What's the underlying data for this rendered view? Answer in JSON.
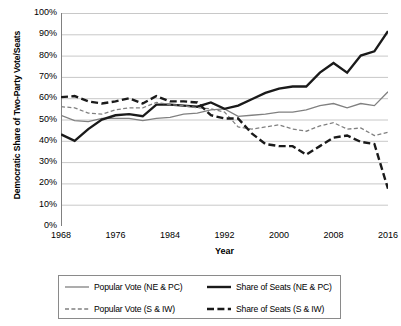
{
  "chart_data": {
    "type": "line",
    "title": "",
    "xlabel": "Year",
    "ylabel": "Democratic Share of Two-Party Vote/Seats",
    "xlim": [
      1968,
      2016
    ],
    "ylim": [
      0,
      1
    ],
    "grid": true,
    "legend_position": "bottom",
    "x_tick_labels": [
      "1968",
      "1976",
      "1984",
      "1992",
      "2000",
      "2008",
      "2016"
    ],
    "x_ticks": [
      1968,
      1976,
      1984,
      1992,
      2000,
      2008,
      2016
    ],
    "y_tick_labels": [
      "0%",
      "10%",
      "20%",
      "30%",
      "40%",
      "50%",
      "60%",
      "70%",
      "80%",
      "90%",
      "100%"
    ],
    "y_ticks": [
      0,
      0.1,
      0.2,
      0.3,
      0.4,
      0.5,
      0.6,
      0.7,
      0.8,
      0.9,
      1.0
    ],
    "x": [
      1968,
      1970,
      1972,
      1974,
      1976,
      1978,
      1980,
      1982,
      1984,
      1986,
      1988,
      1990,
      1992,
      1994,
      1996,
      1998,
      2000,
      2002,
      2004,
      2006,
      2008,
      2010,
      2012,
      2014,
      2016
    ],
    "series": [
      {
        "name": "Popular Vote (NE & PC)",
        "style": "solid-thin",
        "color": "#808080",
        "values": [
          0.52,
          0.495,
          0.49,
          0.505,
          0.505,
          0.505,
          0.495,
          0.505,
          0.51,
          0.525,
          0.53,
          0.545,
          0.55,
          0.515,
          0.52,
          0.525,
          0.535,
          0.535,
          0.545,
          0.565,
          0.575,
          0.555,
          0.575,
          0.565,
          0.63
        ]
      },
      {
        "name": "Share of Seats (NE & PC)",
        "style": "solid-thick",
        "color": "#1a1a1a",
        "values": [
          0.43,
          0.4,
          0.455,
          0.5,
          0.52,
          0.525,
          0.515,
          0.57,
          0.57,
          0.565,
          0.56,
          0.58,
          0.55,
          0.565,
          0.595,
          0.625,
          0.645,
          0.655,
          0.655,
          0.72,
          0.765,
          0.72,
          0.8,
          0.82,
          0.915
        ]
      },
      {
        "name": "Popular Vote (S & IW)",
        "style": "dashed-thin",
        "color": "#808080",
        "values": [
          0.56,
          0.555,
          0.53,
          0.525,
          0.545,
          0.555,
          0.555,
          0.58,
          0.57,
          0.565,
          0.555,
          0.55,
          0.535,
          0.465,
          0.455,
          0.465,
          0.475,
          0.455,
          0.445,
          0.47,
          0.485,
          0.455,
          0.46,
          0.425,
          0.44
        ]
      },
      {
        "name": "Share of Seats (S & IW)",
        "style": "dashed-thick",
        "color": "#1a1a1a",
        "values": [
          0.605,
          0.61,
          0.585,
          0.575,
          0.585,
          0.6,
          0.575,
          0.61,
          0.585,
          0.585,
          0.58,
          0.52,
          0.505,
          0.505,
          0.435,
          0.385,
          0.375,
          0.375,
          0.335,
          0.375,
          0.415,
          0.425,
          0.395,
          0.385,
          0.175
        ]
      }
    ]
  },
  "axis": {
    "y_title": "Democratic Share of Two-Party Vote/Seats",
    "x_title": "Year"
  },
  "legend": {
    "items": [
      {
        "label": "Popular Vote (NE & PC)",
        "style": "solid-thin"
      },
      {
        "label": "Share of Seats (NE & PC)",
        "style": "solid-thick"
      },
      {
        "label": "Popular Vote (S & IW)",
        "style": "dashed-thin"
      },
      {
        "label": "Share of Seats (S & IW)",
        "style": "dashed-thick"
      }
    ]
  },
  "colors": {
    "gray_series": "#808080",
    "black_series": "#1a1a1a",
    "gridline": "#c8c8c8",
    "axis": "#808080",
    "legend_border": "#8a8a8a"
  }
}
